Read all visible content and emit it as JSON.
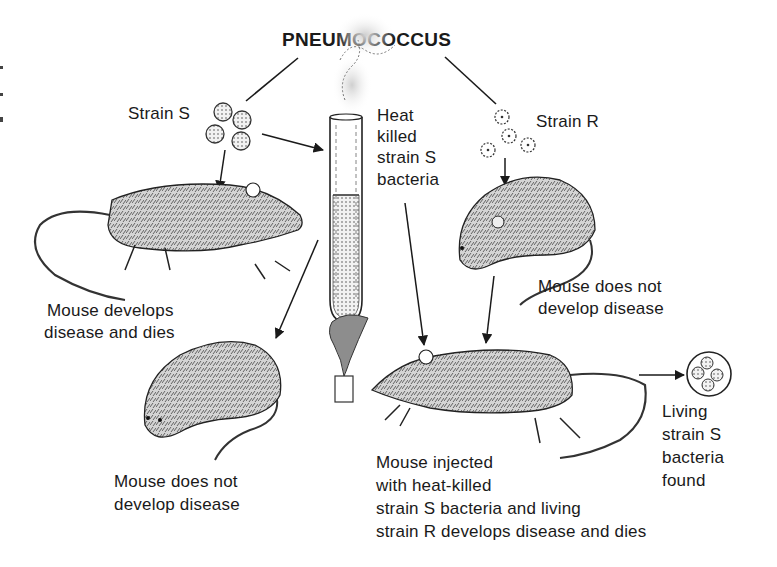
{
  "title": "PNEUMOCOCCUS",
  "labels": {
    "strain_s": "Strain S",
    "strain_r": "Strain R",
    "heat_killed": [
      "Heat",
      "killed",
      "strain S",
      "bacteria"
    ],
    "mouse_dies": [
      "Mouse develops",
      "disease and dies"
    ],
    "mouse_r_survives": [
      "Mouse does not",
      "develop disease"
    ],
    "mouse_heat_killed_survives": [
      "Mouse does not",
      "develop disease"
    ],
    "mouse_injected": [
      "Mouse injected",
      "with heat-killed",
      "strain S bacteria and living",
      "strain R develops disease and dies"
    ],
    "living_found": [
      "Living",
      "strain S",
      "bacteria",
      "found"
    ]
  },
  "colors": {
    "ink": "#1a1a1a",
    "fur": "#8a8a8a",
    "background": "#ffffff"
  },
  "elements": {
    "strain_s_bacteria_count": 4,
    "strain_r_bacteria_count": 4,
    "living_colony_count": 4
  }
}
